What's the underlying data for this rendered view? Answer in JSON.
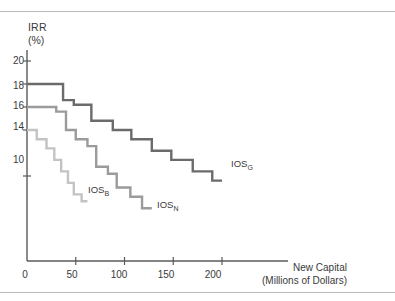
{
  "figure": {
    "background": "#ffffff",
    "rules": {
      "top_y": 11,
      "bottom_y": 292,
      "color": "#b9b9b9"
    }
  },
  "axes": {
    "y_title_line1": "IRR",
    "y_title_line2": "(%)",
    "x_title_line1": "New Capital",
    "x_title_line2": "(Millions of Dollars)",
    "y_ticks": [
      "20",
      "18",
      "16",
      "14",
      "10"
    ],
    "x_ticks": [
      "0",
      "50",
      "100",
      "150",
      "200"
    ],
    "axis_color": "#5a5a5a"
  },
  "series_labels": [
    {
      "base": "IOS",
      "sub": "G"
    },
    {
      "base": "IOS",
      "sub": "B"
    },
    {
      "base": "IOS",
      "sub": "N"
    }
  ],
  "colors": {
    "ios_g": "#6b6b6b",
    "ios_b": "#9b9b9b",
    "ios_n": "#c3c3c3",
    "axis": "#5a5a5a",
    "text": "#3a3a3a"
  },
  "chart_data": {
    "type": "line",
    "title": "",
    "xlabel": "New Capital (Millions of Dollars)",
    "ylabel": "IRR (%)",
    "xlim": [
      0,
      250
    ],
    "ylim": [
      0,
      21
    ],
    "grid": false,
    "legend": "inline-end-of-line",
    "x_ticks": [
      0,
      50,
      100,
      150,
      200
    ],
    "y_ticks": [
      20,
      18,
      16,
      14,
      10
    ],
    "step_style": "post",
    "series": [
      {
        "name": "IOS_G",
        "label": "IOS",
        "subscript": "G",
        "color": "#6b6b6b",
        "description": "Good-economy investment opportunity schedule",
        "steps": [
          {
            "x_start": 0,
            "x_end": 37,
            "irr": 18.0
          },
          {
            "x_start": 37,
            "x_end": 48,
            "irr": 16.6
          },
          {
            "x_start": 48,
            "x_end": 66,
            "irr": 16.2
          },
          {
            "x_start": 66,
            "x_end": 88,
            "irr": 14.8
          },
          {
            "x_start": 88,
            "x_end": 107,
            "irr": 14.0
          },
          {
            "x_start": 107,
            "x_end": 128,
            "irr": 13.2
          },
          {
            "x_start": 128,
            "x_end": 148,
            "irr": 12.2
          },
          {
            "x_start": 148,
            "x_end": 170,
            "irr": 11.4
          },
          {
            "x_start": 170,
            "x_end": 190,
            "irr": 10.4
          },
          {
            "x_start": 190,
            "x_end": 200,
            "irr": 9.6
          }
        ]
      },
      {
        "name": "IOS_B",
        "label": "IOS",
        "subscript": "B",
        "color": "#9b9b9b",
        "description": "Base-case investment opportunity schedule",
        "steps": [
          {
            "x_start": 0,
            "x_end": 30,
            "irr": 16.0
          },
          {
            "x_start": 30,
            "x_end": 40,
            "irr": 15.6
          },
          {
            "x_start": 40,
            "x_end": 50,
            "irr": 14.0
          },
          {
            "x_start": 50,
            "x_end": 62,
            "irr": 13.2
          },
          {
            "x_start": 62,
            "x_end": 71,
            "irr": 12.6
          },
          {
            "x_start": 71,
            "x_end": 83,
            "irr": 10.8
          },
          {
            "x_start": 83,
            "x_end": 92,
            "irr": 10.2
          },
          {
            "x_start": 92,
            "x_end": 106,
            "irr": 9.0
          },
          {
            "x_start": 106,
            "x_end": 118,
            "irr": 8.2
          },
          {
            "x_start": 118,
            "x_end": 128,
            "irr": 7.2
          }
        ]
      },
      {
        "name": "IOS_N",
        "label": "IOS",
        "subscript": "N",
        "color": "#c3c3c3",
        "description": "Bad-economy (low) investment opportunity schedule",
        "steps": [
          {
            "x_start": 0,
            "x_end": 10,
            "irr": 14.0
          },
          {
            "x_start": 10,
            "x_end": 20,
            "irr": 13.2
          },
          {
            "x_start": 20,
            "x_end": 28,
            "irr": 12.4
          },
          {
            "x_start": 28,
            "x_end": 35,
            "irr": 11.4
          },
          {
            "x_start": 35,
            "x_end": 42,
            "irr": 10.4
          },
          {
            "x_start": 42,
            "x_end": 48,
            "irr": 9.4
          },
          {
            "x_start": 48,
            "x_end": 56,
            "irr": 8.4
          },
          {
            "x_start": 56,
            "x_end": 62,
            "irr": 7.8
          }
        ]
      }
    ]
  }
}
